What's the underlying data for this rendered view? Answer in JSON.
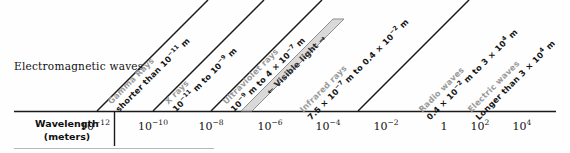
{
  "figure": {
    "left_title": "Electromagnetic waves",
    "axis_title_line1": "Wavelength",
    "axis_title_line2": "(meters)"
  },
  "colors": {
    "band_name": "#9a9a9a",
    "band_range": "#141414",
    "rule": "#1a1a1a",
    "visible_band_fill": "#d9d9d9",
    "visible_band_edge": "#8e8e8e"
  },
  "axis": {
    "ticks": [
      {
        "mantissa": "10",
        "exponent": "−12",
        "label": "10⁻¹²"
      },
      {
        "mantissa": "10",
        "exponent": "−10",
        "label": "10⁻¹⁰"
      },
      {
        "mantissa": "10",
        "exponent": "−8",
        "label": "10⁻⁸"
      },
      {
        "mantissa": "10",
        "exponent": "−6",
        "label": "10⁻⁶"
      },
      {
        "mantissa": "10",
        "exponent": "−4",
        "label": "10⁻⁴"
      },
      {
        "mantissa": "10",
        "exponent": "−2",
        "label": "10⁻²"
      },
      {
        "mantissa": "1",
        "exponent": "",
        "label": "1"
      },
      {
        "mantissa": "10",
        "exponent": "2",
        "label": "10²"
      },
      {
        "mantissa": "10",
        "exponent": "4",
        "label": "10⁴"
      }
    ]
  },
  "bands": [
    {
      "name": "Gamma Rays",
      "range_parts": [
        {
          "t": "shorter than 10"
        },
        {
          "sup": "−11"
        },
        {
          "t": " m"
        }
      ],
      "range_plain": "shorter than 10⁻¹¹ m"
    },
    {
      "name": "X rays",
      "range_parts": [
        {
          "t": "10"
        },
        {
          "sup": "−11"
        },
        {
          "t": " m to 10"
        },
        {
          "sup": "−9"
        },
        {
          "t": " m"
        }
      ],
      "range_plain": "10⁻¹¹ m to 10⁻⁹ m"
    },
    {
      "name": "Ultraviolet rays",
      "range_parts": [
        {
          "t": "10"
        },
        {
          "sup": "−9"
        },
        {
          "t": " m to 4 × 10"
        },
        {
          "sup": "−7"
        },
        {
          "t": " m"
        }
      ],
      "range_plain": "10⁻⁹ m to 4 × 10⁻⁷ m"
    },
    {
      "name": "Infrared rays",
      "range_parts": [
        {
          "t": "7.5 × 10"
        },
        {
          "sup": "−7"
        },
        {
          "t": " m to 0.4 × 10"
        },
        {
          "sup": "−2"
        },
        {
          "t": " m"
        }
      ],
      "range_plain": "7.5 × 10⁻⁷ m to 0.4 × 10⁻² m"
    },
    {
      "name": "Radio waves",
      "range_parts": [
        {
          "t": "0.4 × 10"
        },
        {
          "sup": "−2"
        },
        {
          "t": " m to 3 × 10"
        },
        {
          "sup": "4"
        },
        {
          "t": " m"
        }
      ],
      "range_plain": "0.4 × 10⁻² m to 3 × 10⁴ m"
    },
    {
      "name": "Electric waves",
      "range_parts": [
        {
          "t": "Longer than 3 × 10"
        },
        {
          "sup": "4"
        },
        {
          "t": " m"
        }
      ],
      "range_plain": "Longer than 3 × 10⁴ m"
    }
  ],
  "visible_light": {
    "label": "Visible light",
    "arrow_glyph": "←"
  }
}
